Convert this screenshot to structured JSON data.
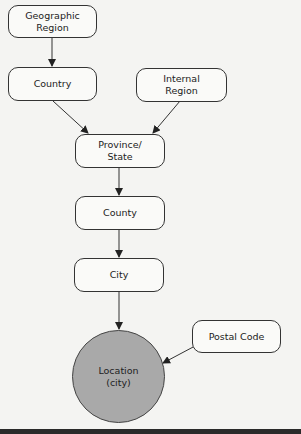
{
  "diagram": {
    "nodes": [
      {
        "id": "geographic_region",
        "label": "Geographic\nRegion",
        "shape": "rounded-rect"
      },
      {
        "id": "country",
        "label": "Country",
        "shape": "rounded-rect"
      },
      {
        "id": "internal_region",
        "label": "Internal\nRegion",
        "shape": "rounded-rect"
      },
      {
        "id": "province_state",
        "label": "Province/\nState",
        "shape": "rounded-rect"
      },
      {
        "id": "county",
        "label": "County",
        "shape": "rounded-rect"
      },
      {
        "id": "city",
        "label": "City",
        "shape": "rounded-rect"
      },
      {
        "id": "postal_code",
        "label": "Postal Code",
        "shape": "rounded-rect"
      },
      {
        "id": "location",
        "label": "Location\n(city)",
        "shape": "circle",
        "fill": "#a9a9a9"
      }
    ],
    "edges": [
      {
        "from": "geographic_region",
        "to": "country"
      },
      {
        "from": "country",
        "to": "province_state"
      },
      {
        "from": "internal_region",
        "to": "province_state"
      },
      {
        "from": "province_state",
        "to": "county"
      },
      {
        "from": "county",
        "to": "city"
      },
      {
        "from": "city",
        "to": "location"
      },
      {
        "from": "postal_code",
        "to": "location"
      }
    ]
  }
}
